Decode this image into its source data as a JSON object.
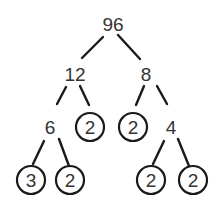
{
  "diagram": {
    "type": "factor-tree",
    "root": "96",
    "nodes": [
      {
        "id": "n96",
        "label": "96",
        "circled": false,
        "x": 113,
        "y": 24
      },
      {
        "id": "n12",
        "label": "12",
        "circled": false,
        "x": 75,
        "y": 74
      },
      {
        "id": "n8",
        "label": "8",
        "circled": false,
        "x": 146,
        "y": 74
      },
      {
        "id": "n6",
        "label": "6",
        "circled": false,
        "x": 50,
        "y": 127
      },
      {
        "id": "n2a",
        "label": "2",
        "circled": true,
        "x": 90,
        "y": 127
      },
      {
        "id": "n2b",
        "label": "2",
        "circled": true,
        "x": 133,
        "y": 127
      },
      {
        "id": "n4",
        "label": "4",
        "circled": false,
        "x": 171,
        "y": 127
      },
      {
        "id": "n3",
        "label": "3",
        "circled": true,
        "x": 31,
        "y": 180
      },
      {
        "id": "n2c",
        "label": "2",
        "circled": true,
        "x": 70,
        "y": 180
      },
      {
        "id": "n2d",
        "label": "2",
        "circled": true,
        "x": 151,
        "y": 180
      },
      {
        "id": "n2e",
        "label": "2",
        "circled": true,
        "x": 193,
        "y": 180
      }
    ],
    "edges": [
      {
        "from": "96",
        "to": "12"
      },
      {
        "from": "96",
        "to": "8"
      },
      {
        "from": "12",
        "to": "6"
      },
      {
        "from": "12",
        "to": "2"
      },
      {
        "from": "8",
        "to": "2"
      },
      {
        "from": "8",
        "to": "4"
      },
      {
        "from": "6",
        "to": "3"
      },
      {
        "from": "6",
        "to": "2"
      },
      {
        "from": "4",
        "to": "2"
      },
      {
        "from": "4",
        "to": "2"
      }
    ],
    "prime_factors": [
      "3",
      "2",
      "2",
      "2",
      "2",
      "2"
    ],
    "colors": {
      "line": "#1a1a1a",
      "text": "#333333",
      "background": "#ffffff"
    }
  }
}
